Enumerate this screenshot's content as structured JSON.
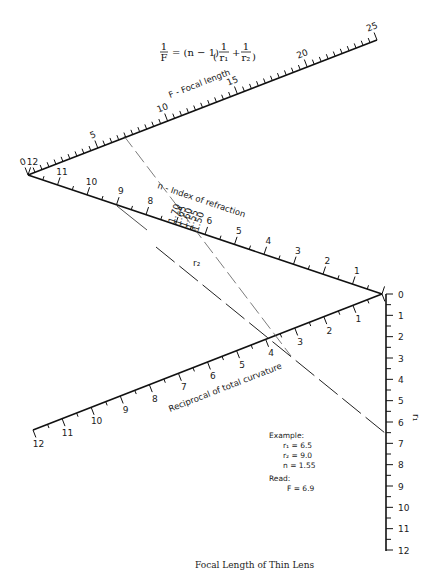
{
  "formula": {
    "lhs": "1/F",
    "text": "= (n − 1)",
    "rhs_terms": [
      "1/r₁",
      "1/r₂"
    ]
  },
  "scales": {
    "focal_length": {
      "title": "F - Focal length",
      "min": 0,
      "max": 25,
      "major_step": 5,
      "minor_step": 0.5,
      "labels": [
        "0",
        "5",
        "10",
        "15",
        "20",
        "25"
      ]
    },
    "r2": {
      "title": "r₂",
      "min": 0,
      "max": 12,
      "major_step": 1,
      "minor_step": 0.5,
      "labels": [
        "12",
        "11",
        "10",
        "9",
        "8",
        "7",
        "6",
        "5",
        "4",
        "3",
        "2",
        "1"
      ]
    },
    "index_of_refraction": {
      "title": "n - Index of refraction",
      "labels": [
        "1.70",
        "1.65",
        "1.60",
        "1.55",
        "1.50"
      ]
    },
    "reciprocal_curvature": {
      "title": "Reciprocal of total curvature",
      "min": 0,
      "max": 12,
      "major_step": 1,
      "minor_step": 0.5,
      "labels": [
        "12",
        "11",
        "10",
        "9",
        "8",
        "7",
        "6",
        "5",
        "4",
        "3",
        "2",
        "1"
      ]
    },
    "r1": {
      "title": "r₁",
      "min": 0,
      "max": 12,
      "major_step": 1,
      "minor_step": 0.5,
      "labels": [
        "0",
        "1",
        "2",
        "3",
        "4",
        "5",
        "6",
        "7",
        "8",
        "9",
        "10",
        "11",
        "12"
      ]
    }
  },
  "example": {
    "heading": "Example:",
    "r1": "r₁ = 6.5",
    "r2": "r₂ = 9.0",
    "n": "n = 1.55",
    "read_heading": "Read:",
    "result": "F = 6.9"
  },
  "caption": "Focal Length of Thin Lens"
}
